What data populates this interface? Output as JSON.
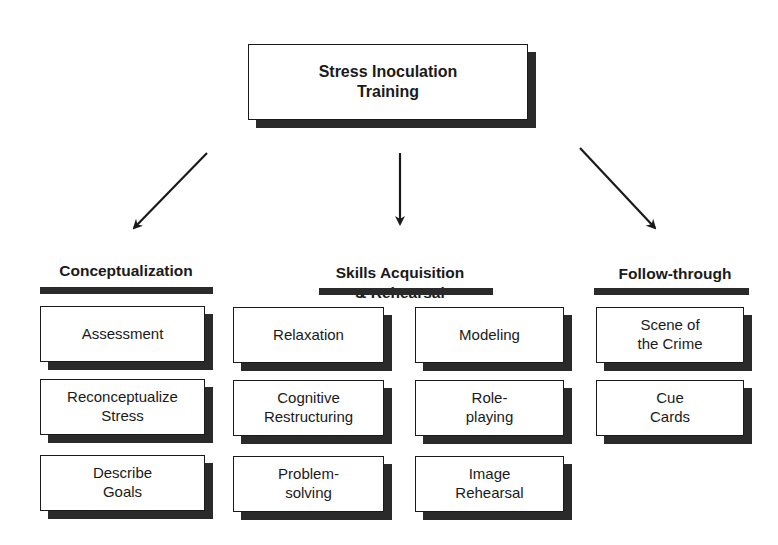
{
  "title": "Stress Inoculation\nTraining",
  "phases": [
    {
      "heading": "Conceptualization",
      "items": [
        "Assessment",
        "Reconceptualize\nStress",
        "Describe\nGoals"
      ]
    },
    {
      "heading": "Skills Acquisition\n& Rehearsal",
      "items": [
        "Relaxation",
        "Cognitive\nRestructuring",
        "Problem-\nsolving",
        "Modeling",
        "Role-\nplaying",
        "Image\nRehearsal"
      ]
    },
    {
      "heading": "Follow-through",
      "items": [
        "Scene of\nthe Crime",
        "Cue\nCards"
      ]
    }
  ],
  "colors": {
    "ink": "#1a1a1a",
    "shadow": "#2a2a2a",
    "background": "#ffffff"
  }
}
